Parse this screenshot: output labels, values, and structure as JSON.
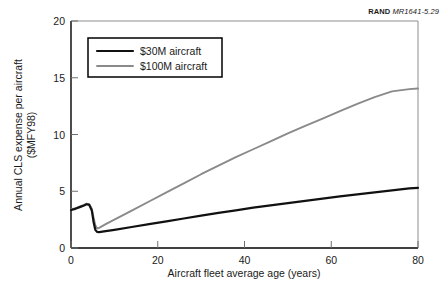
{
  "credit": {
    "brand": "RAND",
    "number": "MR1641-5.29"
  },
  "chart_data": {
    "type": "line",
    "title": "",
    "xlabel": "Aircraft fleet average age (years)",
    "ylabel": "Annual CLS expense per aircraft ($MFY98)",
    "ylabel_line1": "Annual CLS expense per aircraft",
    "ylabel_line2": "($MFY98)",
    "xlim": [
      0,
      80
    ],
    "ylim": [
      0,
      20
    ],
    "xticks": [
      0,
      20,
      40,
      60,
      80
    ],
    "yticks": [
      0,
      5,
      10,
      15,
      20
    ],
    "xticklabels": [
      "0",
      "20",
      "40",
      "60",
      "80"
    ],
    "yticklabels": [
      "0",
      "5",
      "10",
      "15",
      "20"
    ],
    "grid": false,
    "legend_position": "upper-left",
    "series": [
      {
        "name": "$30M aircraft",
        "color": "#111111",
        "width": 2.2,
        "x": [
          0,
          1,
          2,
          3,
          3.6,
          4.2,
          4.8,
          5.2,
          5.6,
          6.0,
          6.5,
          8,
          10,
          14,
          18,
          22,
          26,
          30,
          34,
          38,
          42,
          46,
          50,
          54,
          58,
          62,
          66,
          70,
          74,
          78,
          80
        ],
        "y": [
          3.35,
          3.45,
          3.6,
          3.75,
          3.85,
          3.8,
          3.3,
          2.3,
          1.6,
          1.42,
          1.4,
          1.48,
          1.6,
          1.85,
          2.1,
          2.35,
          2.6,
          2.85,
          3.1,
          3.32,
          3.55,
          3.76,
          3.96,
          4.15,
          4.35,
          4.55,
          4.72,
          4.9,
          5.08,
          5.25,
          5.3
        ]
      },
      {
        "name": "$100M aircraft",
        "color": "#8a8a8a",
        "width": 1.9,
        "x": [
          0,
          1,
          2,
          3,
          3.6,
          4.2,
          4.8,
          5.2,
          5.6,
          6.0,
          6.5,
          8,
          10,
          14,
          18,
          22,
          26,
          30,
          34,
          38,
          42,
          46,
          50,
          54,
          58,
          62,
          66,
          70,
          74,
          78,
          80
        ],
        "y": [
          3.4,
          3.5,
          3.65,
          3.8,
          3.9,
          3.85,
          3.45,
          2.7,
          2.0,
          1.72,
          1.78,
          2.1,
          2.5,
          3.3,
          4.1,
          4.9,
          5.7,
          6.5,
          7.25,
          8.0,
          8.7,
          9.4,
          10.1,
          10.75,
          11.4,
          12.05,
          12.7,
          13.3,
          13.8,
          14.0,
          14.05
        ]
      }
    ]
  }
}
